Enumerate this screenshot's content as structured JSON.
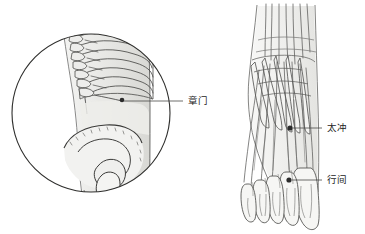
{
  "figure": {
    "title": "",
    "background_color": "#ffffff",
    "line_color": "#3a3a3a",
    "shade_color": "#e8e8e6",
    "point_color": "#2b2b2b",
    "width": 365,
    "height": 234
  },
  "panels": [
    {
      "id": "torso-inset",
      "name": "circular-torso-inset",
      "shape": "circle",
      "center_x": 91,
      "center_y": 113,
      "radius": 79,
      "description": "lateral trunk skeleton: rib cage, thoracic and lumbar vertebrae, ilium and hip joint",
      "structures": [
        "rib-cage",
        "vertebral-column",
        "ilium",
        "acetabulum",
        "femoral-head",
        "body-contour"
      ]
    },
    {
      "id": "foot-dorsum",
      "name": "foot-dorsum-diagram",
      "shape": "freeform",
      "description": "dorsal view of right foot showing extensor tendons, metatarsal bones and toes",
      "structures": [
        "ankle-tendons",
        "metatarsal-bones",
        "extensor-digitorum-tendons",
        "toes",
        "foot-contour"
      ]
    }
  ],
  "acupoints": [
    {
      "id": "LR13",
      "label": "章门",
      "panel": "torso-inset",
      "marker_x": 122,
      "marker_y": 100,
      "leader_x1": 124,
      "leader_y1": 101,
      "leader_x2": 183,
      "leader_y2": 101,
      "label_x": 188,
      "label_y": 104
    },
    {
      "id": "LR3",
      "label": "太冲",
      "panel": "foot-dorsum",
      "marker_x": 290,
      "marker_y": 128,
      "leader_x1": 293,
      "leader_y1": 128,
      "leader_x2": 322,
      "leader_y2": 128,
      "label_x": 327,
      "label_y": 131
    },
    {
      "id": "LR2",
      "label": "行间",
      "panel": "foot-dorsum",
      "marker_x": 289,
      "marker_y": 180,
      "leader_x1": 292,
      "leader_y1": 180,
      "leader_x2": 322,
      "leader_y2": 180,
      "label_x": 327,
      "label_y": 183
    }
  ]
}
